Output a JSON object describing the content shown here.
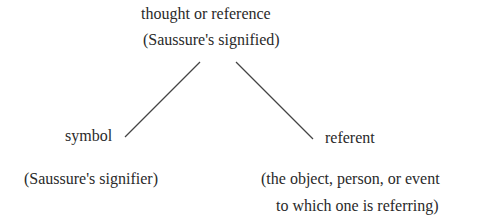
{
  "diagram": {
    "type": "semiotic-triangle",
    "top_node": {
      "line1": "thought or reference",
      "line2": "(Saussure's signified)"
    },
    "left_node": {
      "label": "symbol",
      "note": "(Saussure's signifier)"
    },
    "right_node": {
      "label": "referent",
      "note_line1": "(the object, person, or event",
      "note_line2": "to which one is referring)"
    },
    "edges": [
      {
        "from": "top_node",
        "to": "left_node"
      },
      {
        "from": "top_node",
        "to": "right_node"
      }
    ],
    "colors": {
      "text": "#2a2a2a",
      "line": "#444444",
      "background": "#ffffff"
    }
  }
}
